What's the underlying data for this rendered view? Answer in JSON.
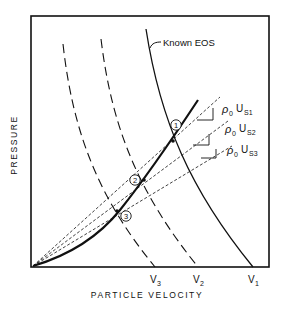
{
  "diagram": {
    "type": "pressure-particle-velocity Hugoniot construction",
    "axes": {
      "xlabel": "PARTICLE VELOCITY",
      "ylabel": "PRESSURE"
    },
    "x_ticks": [
      {
        "label_main": "V",
        "label_sub": "3"
      },
      {
        "label_main": "V",
        "label_sub": "2"
      },
      {
        "label_main": "V",
        "label_sub": "1"
      }
    ],
    "curves": {
      "known_eos_label": "Known EOS"
    },
    "rayleigh_lines": [
      {
        "rho": "ρ",
        "rho_sub": "0",
        "u": "U",
        "u_sub": "S1"
      },
      {
        "rho": "ρ",
        "rho_sub": "0",
        "u": "U",
        "u_sub": "S2"
      },
      {
        "rho": "ρ",
        "rho_sub": "0",
        "u": "U",
        "u_sub": "S3"
      }
    ],
    "points": [
      {
        "label": "1"
      },
      {
        "label": "2"
      },
      {
        "label": "3"
      }
    ],
    "colors": {
      "ink": "#111111",
      "background": "#ffffff"
    }
  }
}
